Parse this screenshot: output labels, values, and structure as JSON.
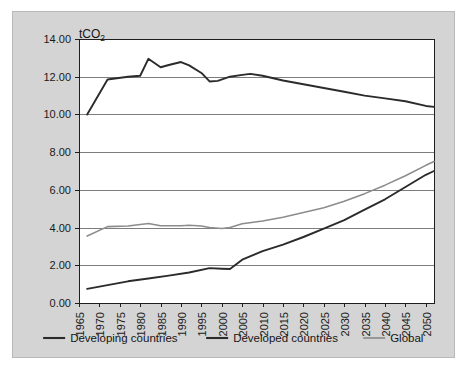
{
  "chart_data": {
    "type": "line",
    "title": "",
    "unit_label": "tCO2",
    "unit_label_base": "tCO",
    "unit_label_sub": "2",
    "xlabel": "",
    "ylabel": "",
    "xlim": [
      1965,
      2052
    ],
    "ylim": [
      0.0,
      14.0
    ],
    "ytick_step": 2.0,
    "xtick_step": 5,
    "grid": true,
    "legend_position": "bottom",
    "ytick_labels": [
      "0.00",
      "2.00",
      "4.00",
      "6.00",
      "8.00",
      "10.00",
      "12.00",
      "14.00"
    ],
    "ytick_values": [
      0.0,
      2.0,
      4.0,
      6.0,
      8.0,
      10.0,
      12.0,
      14.0
    ],
    "xtick_labels": [
      "1965",
      "1970",
      "1975",
      "1980",
      "1985",
      "1990",
      "1995",
      "2000",
      "2005",
      "2010",
      "2015",
      "2020",
      "2025",
      "2030",
      "2035",
      "2040",
      "2045",
      "2050"
    ],
    "xtick_values": [
      1965,
      1970,
      1975,
      1980,
      1985,
      1990,
      1995,
      2000,
      2005,
      2010,
      2015,
      2020,
      2025,
      2030,
      2035,
      2040,
      2045,
      2050
    ],
    "series": [
      {
        "name": "Developing countries",
        "color": "#2b2b2b",
        "width": 1.9,
        "x": [
          1967,
          1972,
          1977,
          1982,
          1987,
          1992,
          1997,
          2000,
          2002,
          2005,
          2010,
          2015,
          2020,
          2025,
          2030,
          2035,
          2040,
          2045,
          2050,
          2052
        ],
        "values": [
          0.75,
          0.95,
          1.15,
          1.3,
          1.45,
          1.62,
          1.85,
          1.82,
          1.8,
          2.3,
          2.75,
          3.1,
          3.5,
          3.95,
          4.4,
          4.95,
          5.5,
          6.15,
          6.8,
          7.0
        ]
      },
      {
        "name": "Developed countries",
        "color": "#2b2b2b",
        "width": 1.9,
        "x": [
          1967,
          1972,
          1977,
          1980,
          1982,
          1985,
          1987,
          1990,
          1992,
          1995,
          1997,
          1999,
          2002,
          2005,
          2007,
          2010,
          2015,
          2020,
          2025,
          2030,
          2035,
          2040,
          2045,
          2050,
          2052
        ],
        "values": [
          10.0,
          11.85,
          12.0,
          12.05,
          12.95,
          12.5,
          12.62,
          12.78,
          12.6,
          12.2,
          11.75,
          11.78,
          12.0,
          12.1,
          12.15,
          12.05,
          11.8,
          11.6,
          11.4,
          11.2,
          11.0,
          10.85,
          10.7,
          10.45,
          10.4
        ]
      },
      {
        "name": "Global",
        "color": "#8c8c8c",
        "width": 1.6,
        "x": [
          1967,
          1972,
          1977,
          1982,
          1985,
          1990,
          1992,
          1995,
          1997,
          2000,
          2002,
          2005,
          2010,
          2015,
          2020,
          2025,
          2030,
          2035,
          2040,
          2045,
          2050,
          2052
        ],
        "values": [
          3.55,
          4.05,
          4.08,
          4.22,
          4.1,
          4.1,
          4.12,
          4.08,
          4.0,
          3.95,
          4.0,
          4.2,
          4.35,
          4.55,
          4.8,
          5.05,
          5.4,
          5.8,
          6.25,
          6.75,
          7.3,
          7.5
        ]
      }
    ],
    "legend": [
      {
        "label": "Developing countries",
        "color": "#2b2b2b",
        "width": 2.1
      },
      {
        "label": "Developed countries",
        "color": "#2b2b2b",
        "width": 2.1
      },
      {
        "label": "Global",
        "color": "#8c8c8c",
        "width": 1.7
      }
    ]
  }
}
